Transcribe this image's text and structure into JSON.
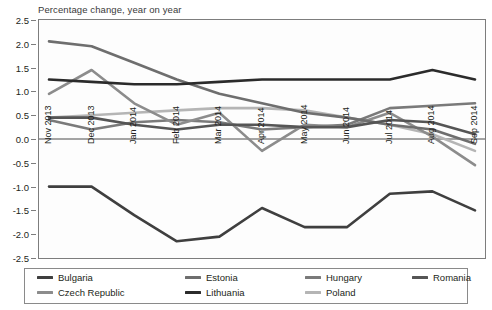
{
  "chart_data": {
    "type": "line",
    "title": "Percentage change, year on year",
    "xlabel": "",
    "ylabel": "",
    "ylim": [
      -2.5,
      2.5
    ],
    "yticks": [
      "2.5",
      "2.0",
      "1.5",
      "1.0",
      "0.5",
      "0.0",
      "-0.5",
      "-1.0",
      "-1.5",
      "-2.0",
      "-2.5"
    ],
    "ytick_values": [
      2.5,
      2.0,
      1.5,
      1.0,
      0.5,
      0.0,
      -0.5,
      -1.0,
      -1.5,
      -2.0,
      -2.5
    ],
    "grid": false,
    "legend_position": "bottom",
    "categories": [
      "Nov 2013",
      "Dec 2013",
      "Jan 2014",
      "Feb 2014",
      "Mar 2014",
      "Apr 2014",
      "May 2014",
      "Jun 2014",
      "Jul 2014",
      "Aug 2014",
      "Sep 2014"
    ],
    "series": [
      {
        "name": "Bulgaria",
        "color": "#3f3f3f",
        "values": [
          -1.0,
          -1.0,
          -1.6,
          -2.15,
          -2.05,
          -1.45,
          -1.85,
          -1.85,
          -1.15,
          -1.1,
          -1.5
        ]
      },
      {
        "name": "Czech Republic",
        "color": "#8c8c8c",
        "values": [
          0.95,
          1.45,
          0.75,
          0.3,
          0.55,
          -0.25,
          0.3,
          0.25,
          0.55,
          0.05,
          -0.55
        ]
      },
      {
        "name": "Estonia",
        "color": "#6e6e6e",
        "values": [
          2.05,
          1.95,
          1.6,
          1.25,
          0.95,
          0.75,
          0.55,
          0.45,
          0.3,
          0.2,
          -0.1
        ]
      },
      {
        "name": "Hungary",
        "color": "#7a7a7a",
        "values": [
          0.4,
          0.2,
          0.35,
          0.4,
          0.35,
          0.2,
          0.25,
          0.3,
          0.65,
          0.7,
          0.75
        ]
      },
      {
        "name": "Lithuania",
        "color": "#2b2b2b",
        "values": [
          1.25,
          1.2,
          1.15,
          1.15,
          1.2,
          1.25,
          1.25,
          1.25,
          1.25,
          1.45,
          1.25
        ]
      },
      {
        "name": "Poland",
        "color": "#b5b5b5",
        "values": [
          0.45,
          0.5,
          0.55,
          0.6,
          0.65,
          0.65,
          0.6,
          0.45,
          0.3,
          0.1,
          -0.25
        ]
      },
      {
        "name": "Romania",
        "color": "#555555",
        "values": [
          0.45,
          0.45,
          0.3,
          0.2,
          0.3,
          0.3,
          0.25,
          0.25,
          0.4,
          0.35,
          0.1
        ]
      }
    ]
  },
  "legend": {
    "items": [
      {
        "label": "Bulgaria"
      },
      {
        "label": "Estonia"
      },
      {
        "label": "Hungary"
      },
      {
        "label": "Romania"
      },
      {
        "label": "Czech Republic"
      },
      {
        "label": "Lithuania"
      },
      {
        "label": "Poland"
      }
    ]
  }
}
